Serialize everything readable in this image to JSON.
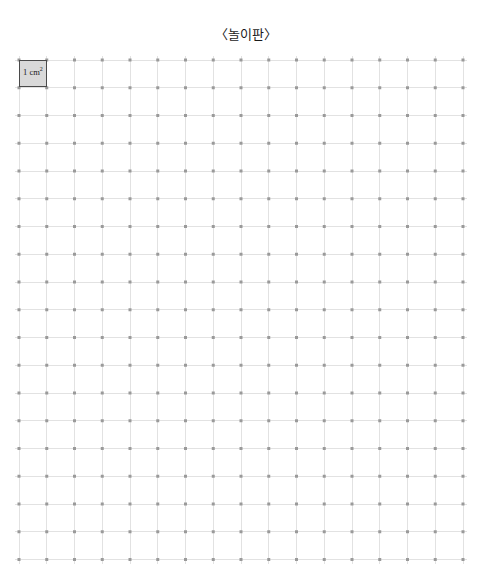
{
  "page": {
    "title": "〈놀이판〉",
    "background_color": "#ffffff"
  },
  "board": {
    "name": "play-board-grid",
    "columns": 16,
    "rows": 18,
    "cell_size_px": 27.75,
    "origin_x_px": 19,
    "origin_y_px": 59.5,
    "line_color": "#e2e2e2",
    "dot_color": "#9a9a9a",
    "dot_size_px": 3
  },
  "unit_cell": {
    "label_text": "1 cm",
    "label_exponent": "2",
    "label_full": "1 cm²",
    "fill_color": "#d9d9d9",
    "border_color": "#4a4a4a",
    "row": 1,
    "column": 1
  }
}
